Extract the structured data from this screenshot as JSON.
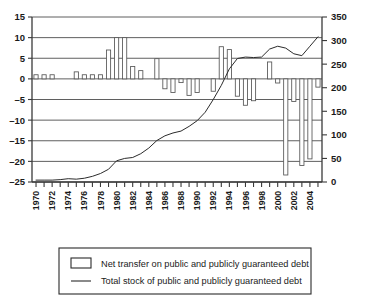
{
  "chart_data": {
    "type": "bar",
    "title": "",
    "subtitle": "",
    "xlabel": "",
    "ylabel": "",
    "y2label": "",
    "grid": true,
    "legend_position": "bottom",
    "x": [
      1970,
      1971,
      1972,
      1973,
      1974,
      1975,
      1976,
      1977,
      1978,
      1979,
      1980,
      1981,
      1982,
      1983,
      1984,
      1985,
      1986,
      1987,
      1988,
      1989,
      1990,
      1991,
      1992,
      1993,
      1994,
      1995,
      1996,
      1997,
      1998,
      1999,
      2000,
      2001,
      2002,
      2003,
      2004,
      2005
    ],
    "xtick_labels": [
      "1970",
      "1972",
      "1974",
      "1976",
      "1978",
      "1980",
      "1982",
      "1984",
      "1986",
      "1988",
      "1990",
      "1992",
      "1994",
      "1996",
      "1998",
      "2000",
      "2002",
      "2004"
    ],
    "ylim": [
      -25,
      15
    ],
    "ytick_labels": [
      "15",
      "10",
      "5",
      "0",
      "-5",
      "-10",
      "-15",
      "-20",
      "-25"
    ],
    "ytick_values": [
      15,
      10,
      5,
      0,
      -5,
      -10,
      -15,
      -20,
      -25
    ],
    "y2lim": [
      0,
      350
    ],
    "y2tick_labels": [
      "350",
      "300",
      "250",
      "200",
      "150",
      "100",
      "50",
      "0"
    ],
    "y2tick_values": [
      350,
      300,
      250,
      200,
      150,
      100,
      50,
      0
    ],
    "series": [
      {
        "name": "Net transfer on public and publicly guaranteed debt",
        "type": "bar",
        "axis": "left",
        "units": "billions",
        "values": [
          1.0,
          1.0,
          1.0,
          0.0,
          0.0,
          1.7,
          1.0,
          1.0,
          1.0,
          7.0,
          10.0,
          10.0,
          3.0,
          2.0,
          0.0,
          4.9,
          -2.4,
          -3.3,
          -0.9,
          -4.0,
          -3.3,
          0.0,
          -3.0,
          7.8,
          7.1,
          -4.2,
          -6.4,
          -5.3,
          0.0,
          4.1,
          -1.0,
          -23.3,
          -5.5,
          -21.0,
          -19.4,
          -2.0
        ]
      },
      {
        "name": "Total stock of public and publicly guaranteed debt",
        "type": "line",
        "axis": "right",
        "units": "billions",
        "values": [
          4,
          4,
          4,
          5,
          7,
          6,
          8,
          12,
          18,
          27,
          45,
          50,
          52,
          60,
          72,
          88,
          98,
          104,
          108,
          118,
          130,
          148,
          175,
          205,
          240,
          262,
          265,
          264,
          265,
          282,
          288,
          284,
          272,
          268,
          288,
          308
        ]
      }
    ],
    "legend": [
      {
        "marker": "box",
        "label": "Net transfer on public and publicly guaranteed debt"
      },
      {
        "marker": "line",
        "label": "Total stock of public and publicly guaranteed debt"
      }
    ]
  },
  "colors": {
    "background": "#ffffff",
    "bar_fill": "#ffffff",
    "bar_stroke": "#555555",
    "line": "#2b2b2b",
    "grid": "#4d4d4d",
    "axis": "#3a3a3a",
    "text": "#1a1a1a"
  }
}
